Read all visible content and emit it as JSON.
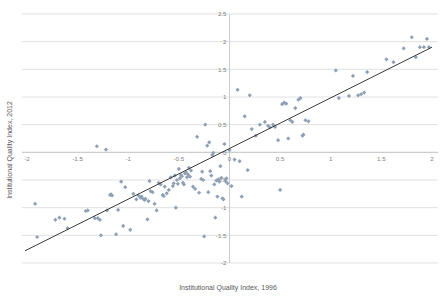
{
  "chart_data": {
    "type": "scatter",
    "title": "",
    "xlabel": "Institutional Quality Index, 1996",
    "ylabel": "Institutional Quality Index, 2012",
    "xlim": [
      -2,
      2
    ],
    "ylim": [
      -2,
      2.5
    ],
    "grid": true,
    "legend": false,
    "xticks": [
      "-2",
      "-1.5",
      "-1",
      "-0.5",
      "0",
      "0.5",
      "1",
      "1.5",
      "2"
    ],
    "xtick_values": [
      -2,
      -1.5,
      -1,
      -0.5,
      0,
      0.5,
      1,
      1.5,
      2
    ],
    "yticks": [
      "-2",
      "-1.5",
      "-1",
      "-0.5",
      "0",
      "0.5",
      "1",
      "1.5",
      "2",
      "2.5"
    ],
    "ytick_values": [
      -2,
      -1.5,
      -1,
      -0.5,
      0,
      0.5,
      1,
      1.5,
      2,
      2.5
    ],
    "marker_color": "#8ea0b5",
    "trendline_color": "#3a3a3a",
    "gridline_color": "#d9d9d9",
    "trendline": {
      "x_start": -2.02,
      "y_start": -1.78,
      "x_end": 2.0,
      "y_end": 1.9
    },
    "points": [
      [
        -1.92,
        -0.93
      ],
      [
        -1.9,
        -1.53
      ],
      [
        -1.72,
        -1.22
      ],
      [
        -1.68,
        -1.18
      ],
      [
        -1.63,
        -1.2
      ],
      [
        -1.6,
        -1.37
      ],
      [
        -1.42,
        -1.06
      ],
      [
        -1.4,
        -1.05
      ],
      [
        -1.33,
        -1.19
      ],
      [
        -1.31,
        0.11
      ],
      [
        -1.3,
        -1.19
      ],
      [
        -1.28,
        -1.22
      ],
      [
        -1.27,
        -1.5
      ],
      [
        -1.22,
        0.05
      ],
      [
        -1.21,
        -1.05
      ],
      [
        -1.18,
        -0.77
      ],
      [
        -1.17,
        -0.76
      ],
      [
        -1.16,
        -0.78
      ],
      [
        -1.12,
        -1.48
      ],
      [
        -1.1,
        -1.04
      ],
      [
        -1.07,
        -0.53
      ],
      [
        -1.05,
        -1.33
      ],
      [
        -1.03,
        -0.63
      ],
      [
        -0.98,
        -1.4
      ],
      [
        -0.95,
        -0.75
      ],
      [
        -0.92,
        -0.85
      ],
      [
        -0.9,
        -0.78
      ],
      [
        -0.88,
        -0.82
      ],
      [
        -0.87,
        -0.8
      ],
      [
        -0.86,
        -0.83
      ],
      [
        -0.84,
        -0.86
      ],
      [
        -0.83,
        -0.84
      ],
      [
        -0.81,
        -1.21
      ],
      [
        -0.8,
        -0.88
      ],
      [
        -0.79,
        -0.52
      ],
      [
        -0.78,
        -0.7
      ],
      [
        -0.76,
        -0.72
      ],
      [
        -0.74,
        -0.93
      ],
      [
        -0.72,
        -1.05
      ],
      [
        -0.7,
        -0.55
      ],
      [
        -0.68,
        -0.58
      ],
      [
        -0.66,
        -0.77
      ],
      [
        -0.65,
        -0.79
      ],
      [
        -0.64,
        -0.62
      ],
      [
        -0.62,
        -0.74
      ],
      [
        -0.6,
        -0.68
      ],
      [
        -0.58,
        -0.45
      ],
      [
        -0.56,
        -0.61
      ],
      [
        -0.55,
        -0.56
      ],
      [
        -0.54,
        -0.42
      ],
      [
        -0.53,
        -1.0
      ],
      [
        -0.52,
        -0.5
      ],
      [
        -0.51,
        -0.57
      ],
      [
        -0.5,
        -0.3
      ],
      [
        -0.49,
        -0.47
      ],
      [
        -0.48,
        -0.41
      ],
      [
        -0.47,
        -0.43
      ],
      [
        -0.46,
        -0.55
      ],
      [
        -0.45,
        -0.58
      ],
      [
        -0.44,
        -0.38
      ],
      [
        -0.43,
        -0.36
      ],
      [
        -0.42,
        -0.45
      ],
      [
        -0.41,
        -0.4
      ],
      [
        -0.4,
        -0.28
      ],
      [
        -0.39,
        -0.44
      ],
      [
        -0.38,
        -0.33
      ],
      [
        -0.36,
        -0.62
      ],
      [
        -0.34,
        -0.66
      ],
      [
        -0.32,
        0.28
      ],
      [
        -0.3,
        -0.73
      ],
      [
        -0.28,
        -0.48
      ],
      [
        -0.27,
        -0.35
      ],
      [
        -0.26,
        -0.5
      ],
      [
        -0.25,
        -1.52
      ],
      [
        -0.24,
        0.5
      ],
      [
        -0.22,
        0.12
      ],
      [
        -0.21,
        -0.72
      ],
      [
        -0.2,
        0.18
      ],
      [
        -0.19,
        -0.34
      ],
      [
        -0.18,
        -0.42
      ],
      [
        -0.17,
        -0.05
      ],
      [
        -0.16,
        -0.01
      ],
      [
        -0.15,
        -0.58
      ],
      [
        -0.14,
        -1.18
      ],
      [
        -0.13,
        -0.51
      ],
      [
        -0.12,
        -0.8
      ],
      [
        -0.11,
        -0.49
      ],
      [
        -0.1,
        -0.53
      ],
      [
        -0.09,
        -0.25
      ],
      [
        -0.08,
        -0.46
      ],
      [
        -0.07,
        -0.83
      ],
      [
        -0.06,
        -0.85
      ],
      [
        -0.05,
        0.15
      ],
      [
        -0.04,
        -0.52
      ],
      [
        -0.03,
        -0.47
      ],
      [
        -0.02,
        -0.56
      ],
      [
        0.0,
        0.04
      ],
      [
        0.02,
        -0.61
      ],
      [
        0.05,
        -0.13
      ],
      [
        0.08,
        1.13
      ],
      [
        0.1,
        -0.16
      ],
      [
        0.12,
        -0.8
      ],
      [
        0.15,
        0.65
      ],
      [
        0.18,
        -0.32
      ],
      [
        0.2,
        1.03
      ],
      [
        0.22,
        0.42
      ],
      [
        0.26,
        0.3
      ],
      [
        0.3,
        0.5
      ],
      [
        0.35,
        0.55
      ],
      [
        0.38,
        0.48
      ],
      [
        0.4,
        0.45
      ],
      [
        0.43,
        0.5
      ],
      [
        0.45,
        0.46
      ],
      [
        0.48,
        0.22
      ],
      [
        0.5,
        -0.68
      ],
      [
        0.52,
        0.87
      ],
      [
        0.54,
        0.9
      ],
      [
        0.56,
        0.88
      ],
      [
        0.58,
        0.25
      ],
      [
        0.6,
        0.58
      ],
      [
        0.62,
        0.55
      ],
      [
        0.65,
        0.8
      ],
      [
        0.68,
        0.95
      ],
      [
        0.7,
        0.98
      ],
      [
        0.72,
        0.3
      ],
      [
        0.73,
        0.32
      ],
      [
        0.75,
        0.58
      ],
      [
        0.78,
        0.56
      ],
      [
        1.05,
        1.48
      ],
      [
        1.08,
        0.98
      ],
      [
        1.18,
        1.02
      ],
      [
        1.22,
        1.38
      ],
      [
        1.27,
        1.03
      ],
      [
        1.3,
        1.05
      ],
      [
        1.33,
        1.08
      ],
      [
        1.36,
        1.45
      ],
      [
        1.55,
        1.68
      ],
      [
        1.62,
        1.63
      ],
      [
        1.72,
        1.88
      ],
      [
        1.8,
        2.08
      ],
      [
        1.84,
        1.72
      ],
      [
        1.88,
        1.9
      ],
      [
        1.92,
        1.9
      ],
      [
        1.95,
        2.05
      ],
      [
        1.97,
        1.9
      ]
    ]
  }
}
